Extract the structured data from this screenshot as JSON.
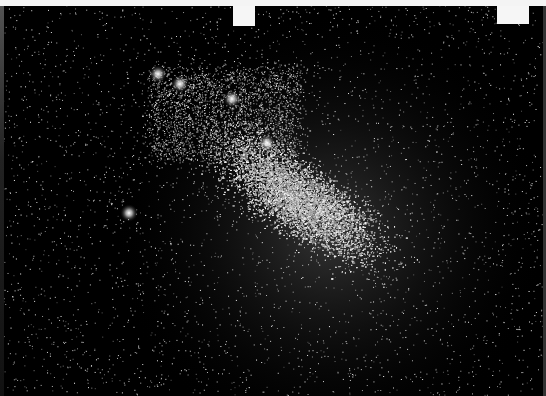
{
  "image": {
    "subject": "dwarf galaxy star field photograph",
    "description": "Dense white star field on black background forming a diagonal cloud of stars, with bright star clusters near upper left",
    "banner": {
      "text": "",
      "background": "#f4f4f4"
    },
    "colors": {
      "background": "#000000",
      "stars": "#ffffff"
    },
    "bright_clusters": [
      {
        "x": 158,
        "y": 74
      },
      {
        "x": 180,
        "y": 84
      },
      {
        "x": 232,
        "y": 99
      },
      {
        "x": 267,
        "y": 143
      },
      {
        "x": 129,
        "y": 213
      }
    ]
  }
}
